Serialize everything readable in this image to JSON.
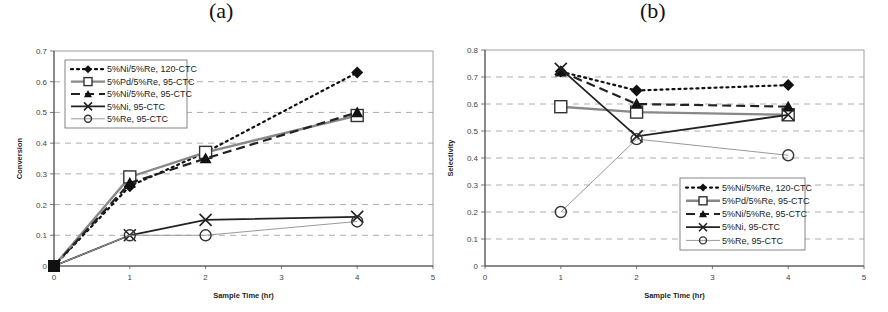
{
  "panels": [
    {
      "label": "(a)"
    },
    {
      "label": "(b)"
    }
  ],
  "chart_data": [
    {
      "type": "line",
      "title": "(a)",
      "xlabel": "Sample Time (hr)",
      "ylabel": "Conversion",
      "xlim": [
        0,
        5
      ],
      "ylim": [
        0,
        0.7
      ],
      "xticks": [
        "0",
        "1",
        "2",
        "3",
        "4",
        "5"
      ],
      "yticks": [
        "0",
        "0.1",
        "0.2",
        "0.3",
        "0.4",
        "0.5",
        "0.6",
        "0.7"
      ],
      "grid": "horizontal dashed",
      "legend_position": "upper left inside",
      "series": [
        {
          "name": "5%Ni/5%Re, 120-CTC",
          "marker": "diamond",
          "line": "dotted",
          "x": [
            0,
            1,
            2,
            4
          ],
          "y": [
            0,
            0.26,
            0.37,
            0.63
          ]
        },
        {
          "name": "5%Pd/5%Re, 95-CTC",
          "marker": "square-open",
          "line": "gray-solid",
          "x": [
            0,
            1,
            2,
            4
          ],
          "y": [
            0,
            0.29,
            0.37,
            0.49
          ]
        },
        {
          "name": "5%Ni/5%Re, 95-CTC",
          "marker": "triangle",
          "line": "dashed",
          "x": [
            0,
            1,
            2,
            4
          ],
          "y": [
            0,
            0.27,
            0.35,
            0.5
          ]
        },
        {
          "name": "5%Ni, 95-CTC",
          "marker": "x",
          "line": "solid",
          "x": [
            0,
            1,
            2,
            4
          ],
          "y": [
            0,
            0.1,
            0.15,
            0.16
          ]
        },
        {
          "name": "5%Re, 95-CTC",
          "marker": "circle-open",
          "line": "thin-gray",
          "x": [
            0,
            1,
            2,
            4
          ],
          "y": [
            0,
            0.1,
            0.1,
            0.145
          ]
        }
      ]
    },
    {
      "type": "line",
      "title": "(b)",
      "xlabel": "Sample Time (hr)",
      "ylabel": "Selectivity",
      "xlim": [
        0,
        5
      ],
      "ylim": [
        0,
        0.8
      ],
      "xticks": [
        "0",
        "1",
        "2",
        "3",
        "4",
        "5"
      ],
      "yticks": [
        "0",
        "0.1",
        "0.2",
        "0.3",
        "0.4",
        "0.5",
        "0.6",
        "0.7",
        "0.8"
      ],
      "grid": "horizontal dashed",
      "legend_position": "lower right inside",
      "series": [
        {
          "name": "5%Ni/5%Re, 120-CTC",
          "marker": "diamond",
          "line": "dotted",
          "x": [
            1,
            2,
            4
          ],
          "y": [
            0.72,
            0.65,
            0.67
          ]
        },
        {
          "name": "5%Pd/5%Re, 95-CTC",
          "marker": "square-open",
          "line": "gray-solid",
          "x": [
            1,
            2,
            4
          ],
          "y": [
            0.59,
            0.57,
            0.56
          ]
        },
        {
          "name": "5%Ni/5%Re, 95-CTC",
          "marker": "triangle",
          "line": "dashed",
          "x": [
            1,
            2,
            4
          ],
          "y": [
            0.72,
            0.6,
            0.59
          ]
        },
        {
          "name": "5%Ni, 95-CTC",
          "marker": "x",
          "line": "solid",
          "x": [
            1,
            2,
            4
          ],
          "y": [
            0.73,
            0.48,
            0.56
          ]
        },
        {
          "name": "5%Re, 95-CTC",
          "marker": "circle-open",
          "line": "thin-gray",
          "x": [
            1,
            2,
            4
          ],
          "y": [
            0.2,
            0.47,
            0.41
          ]
        }
      ]
    }
  ]
}
